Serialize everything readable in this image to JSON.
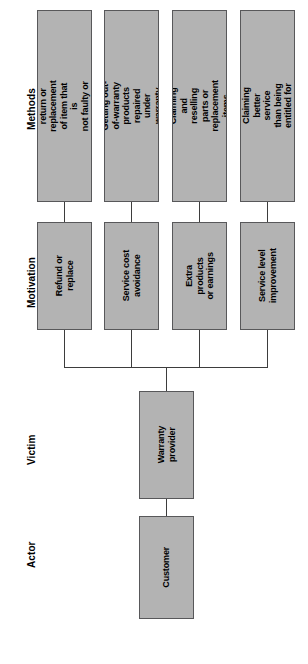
{
  "diagram": {
    "orientation": "rotated-90",
    "colors": {
      "node_fill": "#b3b3b3",
      "node_border": "#58585a",
      "connector": "#3d3d3d",
      "background": "#ffffff",
      "text": "#000000"
    },
    "lanes": [
      {
        "id": "methods",
        "label": "Methods"
      },
      {
        "id": "motivation",
        "label": "Motivation"
      },
      {
        "id": "victim",
        "label": "Victim"
      },
      {
        "id": "actor",
        "label": "Actor"
      }
    ],
    "methods": [
      {
        "id": "m1",
        "label": "Unjustified return or\nreplacement of item that is\nnot faulty or is a fake"
      },
      {
        "id": "m2",
        "label": "Getting out-of-warranty\nproducts repaired under\nwarranty"
      },
      {
        "id": "m3",
        "label": "Claiming and reselling\nparts or replacement items"
      },
      {
        "id": "m4",
        "label": "Claiming better service\nthan being entitled for"
      }
    ],
    "motivations": [
      {
        "id": "v1",
        "label": "Refund or\nreplace"
      },
      {
        "id": "v2",
        "label": "Service cost\navoidance"
      },
      {
        "id": "v3",
        "label": "Extra products\nor earnings"
      },
      {
        "id": "v4",
        "label": "Service level\nimprovement"
      }
    ],
    "victim": {
      "id": "vic1",
      "label": "Warranty\nprovider"
    },
    "actor": {
      "id": "act1",
      "label": "Customer"
    }
  }
}
